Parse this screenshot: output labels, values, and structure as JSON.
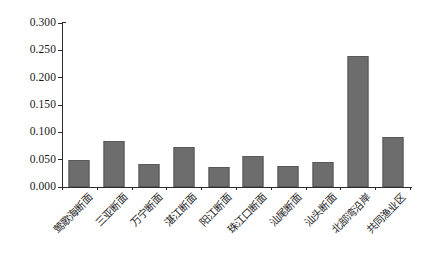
{
  "chart_data": {
    "type": "bar",
    "title": "",
    "subtitle": "",
    "xlabel": "",
    "ylabel": "",
    "ylim": [
      0.0,
      0.3
    ],
    "ytick_labels": [
      "0.300",
      "0.250",
      "0.200",
      "0.150",
      "0.100",
      "0.050",
      "0.000"
    ],
    "ytick_values": [
      0.3,
      0.25,
      0.2,
      0.15,
      0.1,
      0.05,
      0.0
    ],
    "grid": false,
    "legend": null,
    "bar_color": "#6d6d6d",
    "axis_color": "#2b2b2b",
    "categories": [
      "莺歌海断面",
      "三亚断面",
      "万宁断面",
      "湛江断面",
      "阳江断面",
      "珠江口断面",
      "汕尾断面",
      "汕头断面",
      "北部湾沿岸",
      "共同渔业区"
    ],
    "values": [
      0.05,
      0.085,
      0.042,
      0.073,
      0.036,
      0.057,
      0.039,
      0.045,
      0.24,
      0.092
    ]
  }
}
